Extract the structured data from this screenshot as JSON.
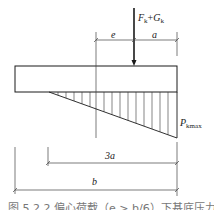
{
  "diagram": {
    "force_label": {
      "main": "F",
      "sub1": "k",
      "plus": "+",
      "main2": "G",
      "sub2": "k"
    },
    "dim_e": "e",
    "dim_a": "a",
    "pressure_label": {
      "main": "P",
      "sub": "kmax"
    },
    "dim_3a": "3a",
    "dim_b": "b",
    "caption": "图 5.2.2  偏心荷载（e > b/6）下基底压力计算示意"
  },
  "colors": {
    "line": "#1a1a1a",
    "thin": "#444444",
    "caption": "#777777"
  }
}
